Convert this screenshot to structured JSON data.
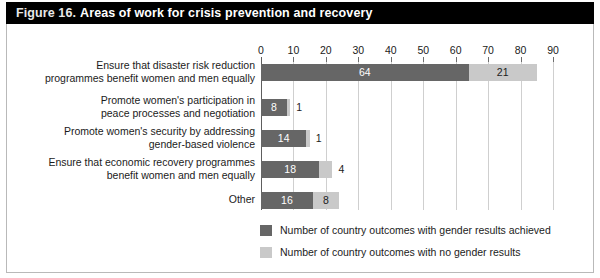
{
  "figure": {
    "label": "Figure 16.",
    "title": "Areas of work for crisis prevention and recovery"
  },
  "chart_data": {
    "type": "bar",
    "orientation": "horizontal",
    "stacked": true,
    "title": "Areas of work for crisis prevention and recovery",
    "xlabel": "",
    "ylabel": "",
    "xlim": [
      0,
      90
    ],
    "xticks": [
      0,
      10,
      20,
      30,
      40,
      50,
      60,
      70,
      80,
      90
    ],
    "grid": true,
    "legend_position": "bottom-left",
    "categories": [
      "Ensure that disaster risk reduction\nprogrammes benefit women and men equally",
      "Promote women's participation in\npeace processes and negotiation",
      "Promote women's security by addressing\ngender-based violence",
      "Ensure that economic recovery programmes\nbenefit women and men equally",
      "Other"
    ],
    "series": [
      {
        "name": "Number of country outcomes with gender results achieved",
        "color": "#666666",
        "values": [
          64,
          8,
          14,
          18,
          16
        ]
      },
      {
        "name": "Number of country outcomes with no gender results",
        "color": "#c9c9c9",
        "values": [
          21,
          1,
          1,
          4,
          8
        ]
      }
    ]
  },
  "legend": {
    "items": [
      {
        "label": "Number of country outcomes with gender results achieved",
        "swatch": "dark"
      },
      {
        "label": "Number of country outcomes with no gender results",
        "swatch": "light"
      }
    ]
  },
  "colors": {
    "title_bar_bg": "#000000",
    "title_text": "#ffffff",
    "bar_dark": "#666666",
    "bar_light": "#c9c9c9",
    "gridline": "#cfcfcf",
    "axis": "#5e5e5e",
    "frame_border": "#b9b9b9"
  }
}
